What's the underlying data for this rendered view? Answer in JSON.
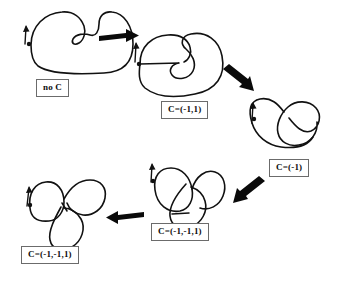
{
  "figure": {
    "background_color": "#ffffff",
    "curve_color": "#111111",
    "arrow_color": "#0a0a0a",
    "label_border_color": "#6b6b6b",
    "width": 342,
    "height": 283
  },
  "steps": [
    {
      "id": "step-1",
      "label": "no  C",
      "label_x": 36,
      "label_y": 79,
      "marker": {
        "arrow": "up-arrow",
        "dot": "basepoint-dot"
      }
    },
    {
      "id": "step-2",
      "label": "C=(-1,1)",
      "label_x": 161,
      "label_y": 101,
      "marker": {
        "arrow": "up-arrow",
        "dot": "basepoint-dot"
      }
    },
    {
      "id": "step-3",
      "label": "C=(-1)",
      "label_x": 269,
      "label_y": 159,
      "marker": {
        "arrow": "up-arrow",
        "dot": "basepoint-dot"
      }
    },
    {
      "id": "step-4",
      "label": "C=(-1,-1,1)",
      "label_x": 151,
      "label_y": 223,
      "marker": {
        "arrow": "up-arrow",
        "dot": "basepoint-dot"
      }
    },
    {
      "id": "step-5",
      "label": "C=(-1,-1,1)",
      "label_x": 21,
      "label_y": 246,
      "marker": {
        "arrow": "up-arrow",
        "dot": "basepoint-dot"
      }
    }
  ],
  "arrows": [
    {
      "id": "arrow-1-2",
      "direction": "right",
      "from": "step-1",
      "to": "step-2"
    },
    {
      "id": "arrow-2-3",
      "direction": "down-right",
      "from": "step-2",
      "to": "step-3"
    },
    {
      "id": "arrow-3-4",
      "direction": "down-left",
      "from": "step-3",
      "to": "step-4"
    },
    {
      "id": "arrow-4-5",
      "direction": "left",
      "from": "step-4",
      "to": "step-5"
    }
  ]
}
